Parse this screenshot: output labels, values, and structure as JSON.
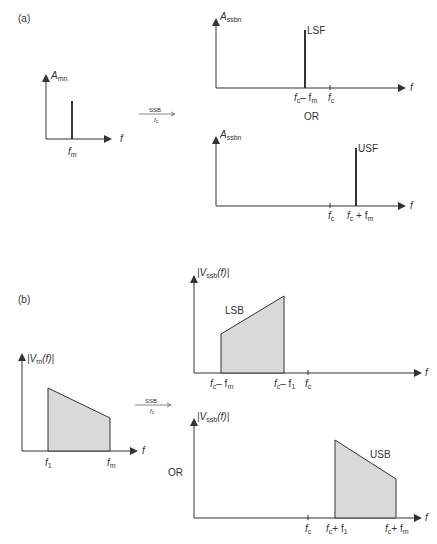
{
  "panel_a": {
    "label": "(a)",
    "input_plot": {
      "ylabel": "A",
      "ylabel_sub": "mn",
      "xlabel": "f",
      "tick": "f",
      "tick_sub": "m"
    },
    "operator": {
      "top": "SSB",
      "bottom": "f",
      "bottom_sub": "c"
    },
    "top_plot": {
      "ylabel": "A",
      "ylabel_sub": "ssbn",
      "xlabel": "f",
      "line_label": "LSF",
      "ticks": [
        {
          "a": "f",
          "a_sub": "c",
          "op": " – ",
          "b": "f",
          "b_sub": "m"
        },
        {
          "a": "f",
          "a_sub": "c"
        }
      ]
    },
    "or_label": "OR",
    "bottom_plot": {
      "ylabel": "A",
      "ylabel_sub": "ssbn",
      "xlabel": "f",
      "line_label": "USF",
      "ticks": [
        {
          "a": "f",
          "a_sub": "c"
        },
        {
          "a": "f",
          "a_sub": "c",
          "op": " + ",
          "b": "f",
          "b_sub": "m"
        }
      ]
    }
  },
  "panel_b": {
    "label": "(b)",
    "input_plot": {
      "ylabel": "|V",
      "ylabel_sub": "m",
      "ylabel_end": "(f)|",
      "xlabel": "f",
      "ticks": [
        {
          "a": "f",
          "a_sub": "1"
        },
        {
          "a": "f",
          "a_sub": "m"
        }
      ]
    },
    "operator": {
      "top": "SSB",
      "bottom": "f",
      "bottom_sub": "c"
    },
    "top_plot": {
      "ylabel": "|V",
      "ylabel_sub": "ssb",
      "ylabel_end": "(f)|",
      "xlabel": "f",
      "region_label": "LSB",
      "ticks": [
        "fc – fm",
        "fc – f1",
        "fc"
      ]
    },
    "or_label": "OR",
    "bottom_plot": {
      "ylabel": "|V",
      "ylabel_sub": "ssb",
      "ylabel_end": "(f)|",
      "xlabel": "f",
      "region_label": "USB",
      "ticks": [
        "fc",
        "fc + f1",
        "fc + fm"
      ]
    }
  },
  "colors": {
    "line": "#333333",
    "fill": "#d9d9d9"
  }
}
